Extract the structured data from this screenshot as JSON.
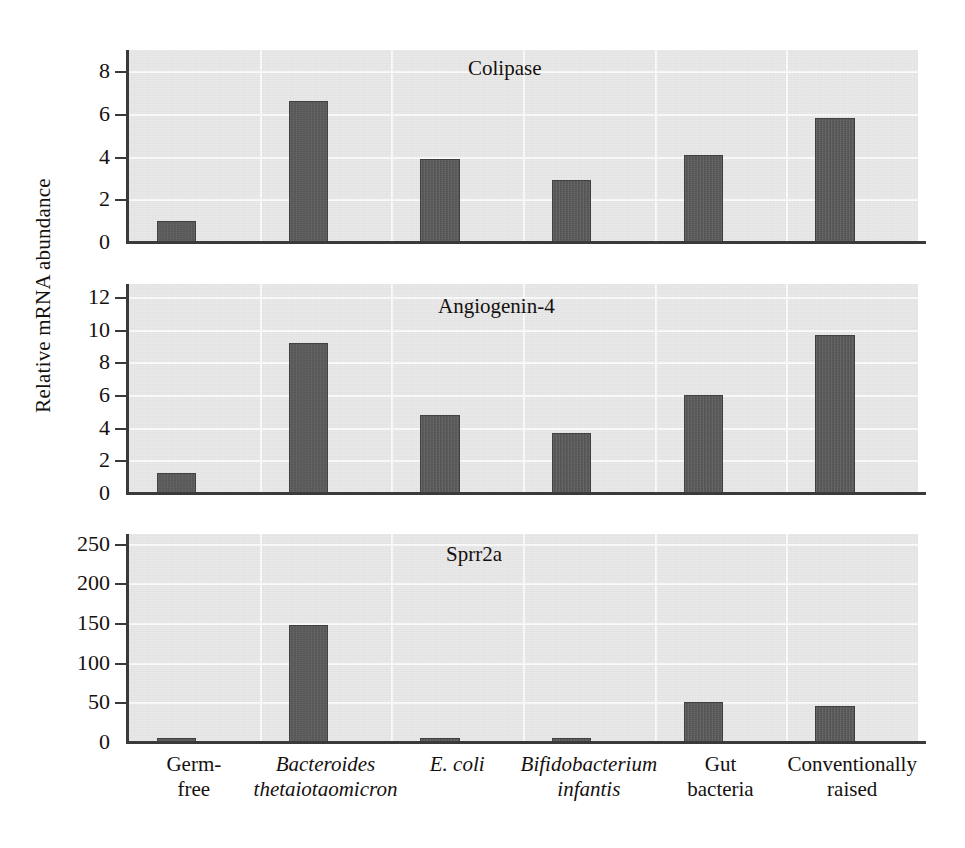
{
  "figure": {
    "ylabel": "Relative mRNA abundance"
  },
  "chart_data": {
    "type": "bar",
    "title": "",
    "xlabel": "",
    "ylabel": "Relative mRNA abundance",
    "grid": true,
    "legend": "none",
    "categories": [
      "Germ-free",
      "Bacteroides thetaiotaomicron",
      "E. coli",
      "Bifidobacterium infantis",
      "Gut bacteria",
      "Conventionally raised"
    ],
    "category_lines": [
      {
        "line1": "Germ-",
        "line2": "free",
        "italic": false
      },
      {
        "line1": "Bacteroides",
        "line2": "thetaiotaomicron",
        "italic": true
      },
      {
        "line1": "E. coli",
        "line2": "",
        "italic": true
      },
      {
        "line1": "Bifidobacterium",
        "line2": "infantis",
        "italic": true
      },
      {
        "line1": "Gut",
        "line2": "bacteria",
        "italic": false
      },
      {
        "line1": "Conventionally",
        "line2": "raised",
        "italic": false
      }
    ],
    "panels": [
      {
        "title": "Colipase",
        "ylim": [
          0,
          9
        ],
        "yticks": [
          0,
          2,
          4,
          6,
          8
        ],
        "values": [
          1.0,
          6.6,
          3.9,
          2.9,
          4.1,
          5.8
        ]
      },
      {
        "title": "Angiogenin-4",
        "ylim": [
          0,
          12.8
        ],
        "yticks": [
          0,
          2,
          4,
          6,
          8,
          10,
          12
        ],
        "values": [
          1.2,
          9.2,
          4.8,
          3.7,
          6.0,
          9.7
        ]
      },
      {
        "title": "Sprr2a",
        "ylim": [
          0,
          262
        ],
        "yticks": [
          0,
          50,
          100,
          150,
          200,
          250
        ],
        "values": [
          3,
          148,
          3,
          4,
          50,
          45
        ]
      }
    ]
  },
  "colors": {
    "bar_fill": "#5b5b5b",
    "bar_stroke": "#3d3d3d",
    "panel_background": "#e9e9e9",
    "gridline": "#fbfbfb",
    "axis": "#3a3a3a",
    "text": "#15110f"
  }
}
